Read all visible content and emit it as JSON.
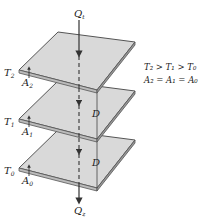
{
  "diagram": {
    "heat_in_label": "Q",
    "heat_in_sub": "t",
    "heat_out_label": "Q",
    "heat_out_sub": "z",
    "plates": [
      {
        "temp_label": "T",
        "temp_sub": "2",
        "area_label": "A",
        "area_sub": "2"
      },
      {
        "temp_label": "T",
        "temp_sub": "1",
        "area_label": "A",
        "area_sub": "1"
      },
      {
        "temp_label": "T",
        "temp_sub": "0",
        "area_label": "A",
        "area_sub": "0"
      }
    ],
    "gap_labels": [
      "D",
      "D"
    ],
    "relations": {
      "line1": "T₂ > T₁ > T₀",
      "line2": "A₂ = A₁ = A₀"
    },
    "colors": {
      "plate_fill": "#d9d9d9",
      "plate_edge": "#555555",
      "line": "#333333"
    }
  }
}
